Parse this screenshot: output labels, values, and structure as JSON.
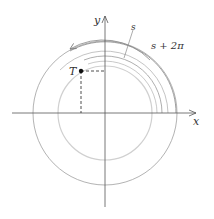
{
  "diagram": {
    "labels": {
      "x_axis": "x",
      "y_axis": "y",
      "point": "T",
      "arc_s": "s",
      "arc_s_plus_2pi": "s + 2π"
    },
    "colors": {
      "axis": "#555555",
      "outer_circle": "#9a9a9a",
      "inner_circle": "#cccccc",
      "arc": "#888888",
      "point": "#111111"
    }
  }
}
